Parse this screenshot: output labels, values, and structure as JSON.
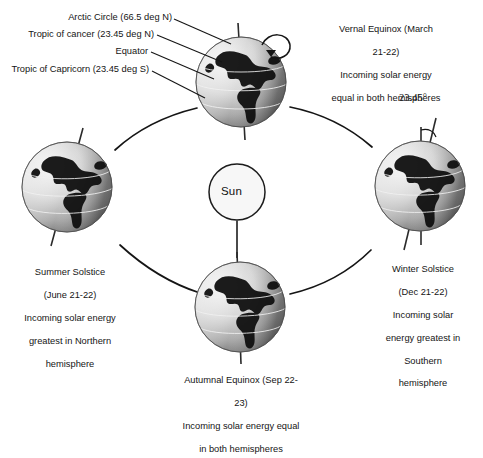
{
  "diagram": {
    "title_alt": "Earth seasons orbit diagram",
    "background": "#ffffff",
    "ink": "#111111"
  },
  "sun": {
    "label": "Sun",
    "cx": 237,
    "cy": 192,
    "r": 28
  },
  "annotations": {
    "tilt": "23.45°"
  },
  "globe_labels": {
    "arctic_circle": "Arctic Circle (66.5 deg N)",
    "tropic_cancer": "Tropic of cancer (23.45 deg N)",
    "equator": "Equator",
    "tropic_capricorn": "Tropic of Capricorn (23.45 deg S)"
  },
  "positions": {
    "vernal": {
      "name": "Vernal Equinox",
      "line1": "Vernal Equinox (March",
      "line2": "21-22)",
      "line3": "Incoming solar energy",
      "line4": "equal in both hemispheres"
    },
    "summer": {
      "name": "Summer Solstice",
      "line1": "Summer  Solstice",
      "line2": "(June 21-22)",
      "line3": "Incoming solar energy",
      "line4": "greatest in Northern",
      "line5": "hemisphere"
    },
    "winter": {
      "name": "Winter Solstice",
      "line1": "Winter Solstice",
      "line2": "(Dec 21-22)",
      "line3": "Incoming solar",
      "line4": "energy greatest in",
      "line5": "Southern",
      "line6": "hemisphere"
    },
    "autumnal": {
      "name": "Autumnal Equinox",
      "line1": "Autumnal Equinox (Sep 22-",
      "line2": "23)",
      "line3": "Incoming solar energy equal",
      "line4": "in both hemispheres"
    }
  }
}
